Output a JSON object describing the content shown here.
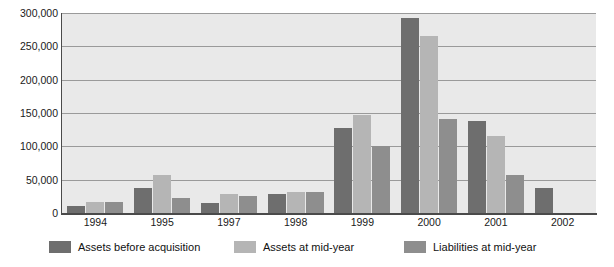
{
  "chart_data": {
    "type": "bar",
    "title": "",
    "xlabel": "",
    "ylabel": "",
    "categories": [
      "1994",
      "1995",
      "1997",
      "1998",
      "1999",
      "2000",
      "2001",
      "2002"
    ],
    "series": [
      {
        "name": "Assets before acquisition",
        "color": "#6e6e6e",
        "values": [
          10000,
          38000,
          15000,
          28000,
          128000,
          293000,
          138000,
          38000
        ]
      },
      {
        "name": "Assets at mid-year",
        "color": "#b5b5b5",
        "values": [
          16000,
          57000,
          28000,
          32000,
          147000,
          266000,
          116000,
          null
        ]
      },
      {
        "name": "Liabilities at mid-year",
        "color": "#8e8e8e",
        "values": [
          16000,
          22000,
          25000,
          31000,
          100000,
          141000,
          57000,
          null
        ]
      }
    ],
    "ylim": [
      0,
      300000
    ],
    "yticks": [
      0,
      50000,
      100000,
      150000,
      200000,
      250000,
      300000
    ],
    "ytick_labels": [
      "0",
      "50,000",
      "100,000",
      "150,000",
      "200,000",
      "250,000",
      "300,000"
    ],
    "grid": true,
    "legend_position": "bottom"
  }
}
